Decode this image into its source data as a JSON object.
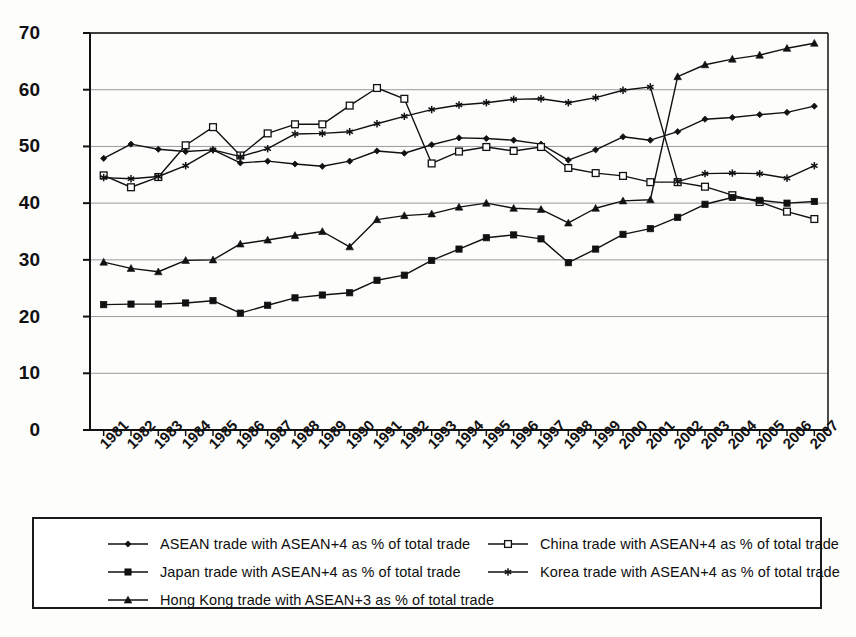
{
  "chart_data": {
    "type": "line",
    "title": "",
    "subtitle": "",
    "xlabel": "",
    "ylabel": "",
    "ylim": [
      0,
      70
    ],
    "ytick_step": 10,
    "yticks": [
      0,
      10,
      20,
      30,
      40,
      50,
      60,
      70
    ],
    "grid": true,
    "legend_position": "bottom",
    "categories": [
      "1981",
      "1982",
      "1983",
      "1984",
      "1985",
      "1986",
      "1987",
      "1988",
      "1989",
      "1990",
      "1991",
      "1992",
      "1993",
      "1994",
      "1995",
      "1996",
      "1997",
      "1998",
      "1999",
      "2000",
      "2001",
      "2002",
      "2003",
      "2004",
      "2005",
      "2006",
      "2007"
    ],
    "series": [
      {
        "name": "ASEAN trade with ASEAN+4 as % of total trade",
        "marker": "diamond",
        "values": [
          47.9,
          50.4,
          49.5,
          49.1,
          49.4,
          47.1,
          47.4,
          46.9,
          46.5,
          47.4,
          49.2,
          48.8,
          50.3,
          51.5,
          51.4,
          51.1,
          50.4,
          47.6,
          49.4,
          51.7,
          51.1,
          52.6,
          54.8,
          55.1,
          55.6,
          56.0,
          57.1
        ]
      },
      {
        "name": "China trade with ASEAN+4 as % of total trade",
        "marker": "open-square",
        "values": [
          44.9,
          42.8,
          44.6,
          50.2,
          53.4,
          48.4,
          52.3,
          53.9,
          53.9,
          57.2,
          60.3,
          58.4,
          47.0,
          49.1,
          49.9,
          49.2,
          49.9,
          46.2,
          45.3,
          44.8,
          43.7,
          43.7,
          42.9,
          41.4,
          40.2,
          38.5,
          37.2
        ]
      },
      {
        "name": "Japan trade with ASEAN+4 as % of total trade",
        "marker": "filled-square",
        "values": [
          22.1,
          22.2,
          22.2,
          22.4,
          22.8,
          20.6,
          22.0,
          23.3,
          23.8,
          24.2,
          26.4,
          27.3,
          29.9,
          31.9,
          33.9,
          34.4,
          33.7,
          29.5,
          31.9,
          34.5,
          35.5,
          37.5,
          39.8,
          41.0,
          40.5,
          40.0,
          40.3
        ]
      },
      {
        "name": "Korea trade with ASEAN+4 as % of total trade",
        "marker": "asterisk",
        "values": [
          44.5,
          44.3,
          44.7,
          46.6,
          49.4,
          48.2,
          49.6,
          52.2,
          52.3,
          52.6,
          54.0,
          55.3,
          56.5,
          57.3,
          57.7,
          58.3,
          58.4,
          57.7,
          58.6,
          59.9,
          60.5,
          43.8,
          45.2,
          45.3,
          45.2,
          44.4,
          46.6
        ]
      },
      {
        "name": "Hong Kong trade with ASEAN+3 as % of total trade",
        "marker": "triangle",
        "values": [
          29.6,
          28.5,
          27.9,
          29.9,
          30.0,
          32.8,
          33.5,
          34.3,
          35.0,
          32.3,
          37.1,
          37.8,
          38.1,
          39.3,
          40.0,
          39.1,
          38.9,
          36.5,
          39.1,
          40.4,
          40.6,
          62.3,
          64.4,
          65.4,
          66.1,
          67.3,
          68.2
        ]
      }
    ]
  },
  "legend": {
    "entries": [
      {
        "label": "ASEAN trade with ASEAN+4 as % of total trade",
        "marker": "diamond"
      },
      {
        "label": "China trade with ASEAN+4 as % of total trade",
        "marker": "open-square"
      },
      {
        "label": "Japan trade with ASEAN+4 as % of total trade",
        "marker": "filled-square"
      },
      {
        "label": "Korea trade with ASEAN+4 as % of total trade",
        "marker": "asterisk"
      },
      {
        "label": "Hong Kong trade with ASEAN+3 as % of total trade",
        "marker": "triangle"
      }
    ]
  },
  "colors": {
    "line": "#111111",
    "grid": "#9a9a9a",
    "axis": "#111111",
    "background": "#fdfdfc"
  }
}
